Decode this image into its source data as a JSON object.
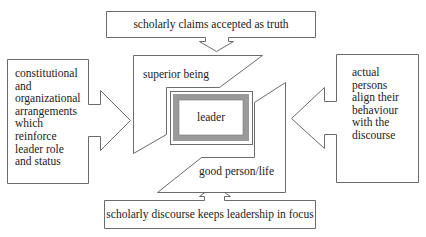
{
  "diagram": {
    "top_box": {
      "text": "scholarly claims accepted as truth"
    },
    "bottom_box": {
      "text": "scholarly discourse keeps leadership in focus"
    },
    "left_box": {
      "lines": [
        "constitutional",
        "and",
        "organizational",
        "arrangements",
        "which",
        "reinforce",
        "leader role",
        "and status"
      ]
    },
    "right_box": {
      "lines": [
        "actual",
        "persons",
        "align their",
        "behaviour",
        "with the",
        "discourse"
      ]
    },
    "upper_frame": {
      "text": "superior being"
    },
    "lower_frame": {
      "text": "good person/life"
    },
    "center": {
      "text": "leader"
    },
    "colors": {
      "stroke": "#6b6b6b",
      "leader_frame": "#9a9a9a",
      "text": "#222222",
      "background": "#ffffff"
    }
  }
}
